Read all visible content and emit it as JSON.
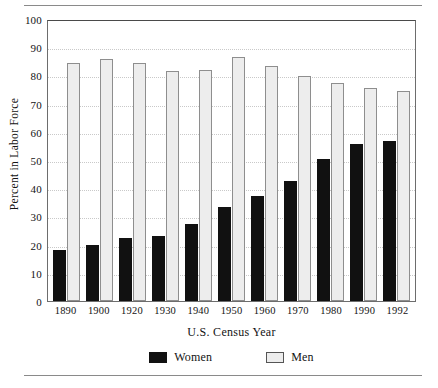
{
  "chart_data": {
    "type": "bar",
    "title": "",
    "xlabel": "U.S. Census Year",
    "ylabel": "Percent in Labor Force",
    "ylim": [
      0,
      100
    ],
    "ytick_step": 10,
    "grid": "horizontal-dotted",
    "legend_position": "bottom-center",
    "categories": [
      "1890",
      "1900",
      "1920",
      "1930",
      "1940",
      "1950",
      "1960",
      "1970",
      "1980",
      "1990",
      "1992"
    ],
    "series": [
      {
        "name": "Women",
        "color": "#111111",
        "values": [
          18.2,
          19.8,
          22.3,
          23.2,
          27.4,
          33.3,
          37.1,
          42.6,
          50.5,
          55.8,
          56.6
        ]
      },
      {
        "name": "Men",
        "color": "#ededed",
        "values": [
          84.3,
          85.7,
          84.3,
          81.6,
          81.9,
          86.4,
          83.3,
          79.7,
          77.2,
          75.4,
          74.5
        ]
      }
    ],
    "yticks": [
      "0",
      "10",
      "20",
      "30",
      "40",
      "50",
      "60",
      "70",
      "80",
      "90",
      "100"
    ]
  }
}
